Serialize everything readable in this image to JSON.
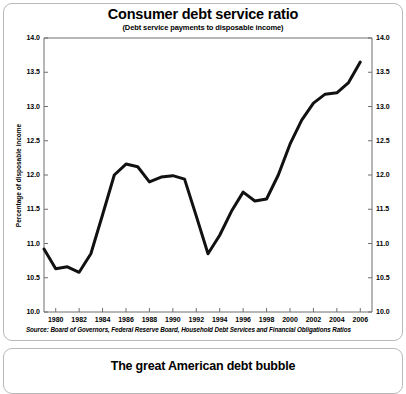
{
  "chart_card": {
    "title": "Consumer debt service ratio",
    "subtitle": "(Debt service payments to disposable income)",
    "source": "Source: Board of Governors, Federal Reserve Board, Household Debt Services and Financial Obligations Ratios"
  },
  "bubble_card": {
    "title": "The great American debt bubble"
  },
  "chart_data": {
    "type": "line",
    "title": "Consumer debt service ratio",
    "subtitle": "(Debt service payments to disposable income)",
    "xlabel": "",
    "ylabel": "Percentage of disposable income",
    "ylim": [
      10.0,
      14.0
    ],
    "xlim": [
      1979,
      2007
    ],
    "grid": false,
    "legend": null,
    "line_color": "#111111",
    "line_width": 3.0,
    "y_ticks": [
      "10.0",
      "10.5",
      "11.0",
      "11.5",
      "12.0",
      "12.5",
      "13.0",
      "13.5",
      "14.0"
    ],
    "y_tick_values": [
      10.0,
      10.5,
      11.0,
      11.5,
      12.0,
      12.5,
      13.0,
      13.5,
      14.0
    ],
    "y_axis_both_sides": true,
    "x_ticks": [
      "1980",
      "1982",
      "1984",
      "1986",
      "1988",
      "1990",
      "1992",
      "1994",
      "1996",
      "1998",
      "2000",
      "2002",
      "2004",
      "2006"
    ],
    "x_tick_values": [
      1980,
      1982,
      1984,
      1986,
      1988,
      1990,
      1992,
      1994,
      1996,
      1998,
      2000,
      2002,
      2004,
      2006
    ],
    "x": [
      1979,
      1980,
      1981,
      1982,
      1983,
      1984,
      1985,
      1986,
      1987,
      1988,
      1989,
      1990,
      1991,
      1992,
      1993,
      1994,
      1995,
      1996,
      1997,
      1998,
      1999,
      2000,
      2001,
      2002,
      2003,
      2004,
      2005,
      2006
    ],
    "values": [
      10.92,
      10.63,
      10.66,
      10.58,
      10.85,
      11.42,
      12.0,
      12.16,
      12.12,
      11.9,
      11.97,
      11.99,
      11.94,
      11.4,
      10.85,
      11.12,
      11.47,
      11.75,
      11.62,
      11.65,
      12.0,
      12.45,
      12.8,
      13.05,
      13.18,
      13.2,
      13.35,
      13.65
    ],
    "series": [
      {
        "name": "Consumer debt service ratio",
        "values": [
          10.92,
          10.63,
          10.66,
          10.58,
          10.85,
          11.42,
          12.0,
          12.16,
          12.12,
          11.9,
          11.97,
          11.99,
          11.94,
          11.4,
          10.85,
          11.12,
          11.47,
          11.75,
          11.62,
          11.65,
          12.0,
          12.45,
          12.8,
          13.05,
          13.18,
          13.2,
          13.35,
          13.65
        ]
      }
    ]
  }
}
